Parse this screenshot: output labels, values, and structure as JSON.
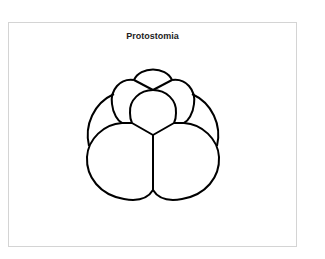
{
  "figure": {
    "title": "Protostomia",
    "stroke_color": "#000000",
    "border_color": "#d4d4d4"
  }
}
